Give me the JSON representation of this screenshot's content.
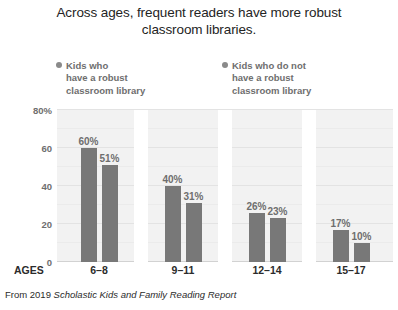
{
  "title": "Across ages, frequent readers have more robust classroom libraries.",
  "ages_axis_label": "AGES",
  "source": {
    "prefix": "From 2019 ",
    "report_title": "Scholastic Kids and Family Reading Report"
  },
  "legend": {
    "items": [
      {
        "label": "Kids who\nhave a robust\nclassroom library",
        "bullet_color": "#8a8a8a"
      },
      {
        "label": "Kids who do not\nhave a robust\nclassroom library",
        "bullet_color": "#8a8a8a"
      }
    ]
  },
  "colors": {
    "bar": "#787878",
    "plot_background": "#f2f2f2",
    "gridline": "#e3e3e3",
    "label_text": "#6e6e6e",
    "title_text": "#242424"
  },
  "chart_data": {
    "type": "bar",
    "title": "Across ages, frequent readers have more robust classroom libraries.",
    "xlabel": "AGES",
    "ylabel": "",
    "ylim": [
      0,
      80
    ],
    "yticks": [
      0,
      20,
      40,
      60,
      80
    ],
    "ytick_labels": [
      "0",
      "20",
      "40",
      "60",
      "80%"
    ],
    "grid": true,
    "legend_position": "top",
    "categories": [
      "6–8",
      "9–11",
      "12–14",
      "15–17"
    ],
    "series": [
      {
        "name": "Kids who have a robust classroom library",
        "values": [
          60,
          40,
          26,
          17
        ],
        "data_labels": [
          "60%",
          "40%",
          "26%",
          "17%"
        ]
      },
      {
        "name": "Kids who do not have a robust classroom library",
        "values": [
          51,
          31,
          23,
          10
        ],
        "data_labels": [
          "51%",
          "31%",
          "23%",
          "10%"
        ]
      }
    ]
  }
}
